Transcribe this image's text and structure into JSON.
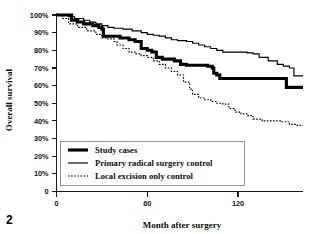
{
  "figure": {
    "number_label": "2",
    "background_color": "#ffffff",
    "ink_color": "#000000"
  },
  "chart_data": {
    "type": "line",
    "title": "",
    "subtitle": "",
    "xlabel": "Month after surgery",
    "ylabel": "Overall survival",
    "xlim": [
      0,
      163
    ],
    "ylim": [
      0,
      100
    ],
    "grid": false,
    "legend_position": "inside-bottom-left",
    "x_ticks": [
      0,
      60,
      120
    ],
    "x_tick_labels": [
      "0",
      "60",
      "120"
    ],
    "y_ticks": [
      0,
      10,
      20,
      30,
      40,
      50,
      60,
      70,
      80,
      90,
      100
    ],
    "y_tick_labels": [
      "0",
      "10%",
      "20%",
      "30%",
      "40%",
      "50%",
      "60%",
      "70%",
      "80%",
      "90%",
      "100%"
    ],
    "annotations": [],
    "series": [
      {
        "name": "Study cases",
        "style": "solid-thick",
        "color": "#000000",
        "x": [
          0,
          6,
          10,
          14,
          18,
          24,
          28,
          30,
          31,
          36,
          42,
          48,
          52,
          55,
          56,
          60,
          63,
          66,
          70,
          78,
          82,
          86,
          88,
          96,
          100,
          103,
          104,
          106,
          108,
          130,
          150,
          152,
          163
        ],
        "y": [
          100,
          100,
          97,
          96,
          95,
          94,
          93,
          92,
          88,
          88,
          87,
          86,
          85,
          85,
          81,
          80,
          79,
          76,
          75,
          74,
          72,
          71.5,
          71.5,
          71.5,
          71,
          70,
          67,
          66,
          64,
          64,
          64,
          59,
          59
        ]
      },
      {
        "name": "Primary radical surgery control",
        "style": "solid-thin",
        "color": "#000000",
        "x": [
          0,
          5,
          8,
          12,
          18,
          22,
          26,
          30,
          34,
          38,
          44,
          50,
          56,
          60,
          64,
          68,
          72,
          76,
          80,
          86,
          90,
          94,
          98,
          102,
          106,
          110,
          114,
          118,
          122,
          126,
          130,
          134,
          140,
          146,
          150,
          154,
          157,
          163
        ],
        "y": [
          100,
          100,
          99,
          98,
          97,
          96,
          95,
          94,
          93,
          92.5,
          92,
          91,
          90,
          89,
          88.5,
          88,
          87,
          86,
          85.5,
          85,
          84,
          83,
          82,
          81,
          80,
          79,
          79,
          79,
          79,
          78.5,
          78,
          76,
          74,
          72,
          71,
          70,
          65.5,
          65.5
        ]
      },
      {
        "name": "Local excision only control",
        "style": "dotted",
        "color": "#000000",
        "x": [
          0,
          4,
          8,
          14,
          20,
          26,
          30,
          34,
          38,
          40,
          44,
          48,
          52,
          56,
          60,
          64,
          68,
          72,
          76,
          80,
          84,
          88,
          90,
          94,
          98,
          102,
          106,
          110,
          114,
          118,
          122,
          126,
          130,
          136,
          142,
          148,
          154,
          158,
          163
        ],
        "y": [
          100,
          98,
          95,
          93,
          91,
          89,
          87,
          86.5,
          85,
          83,
          81,
          79,
          78,
          77,
          76,
          74,
          72,
          70,
          68,
          66,
          62,
          58,
          55,
          53,
          52,
          51,
          50,
          49.5,
          47,
          45,
          44,
          43,
          41,
          40,
          40,
          39.5,
          38,
          37.5,
          37.5
        ]
      }
    ]
  },
  "legend": {
    "entries": [
      {
        "label": "Study cases",
        "style": "solid-thick"
      },
      {
        "label": "Primary radical surgery control",
        "style": "solid-thin"
      },
      {
        "label": "Local excision only control",
        "style": "dotted"
      }
    ]
  }
}
